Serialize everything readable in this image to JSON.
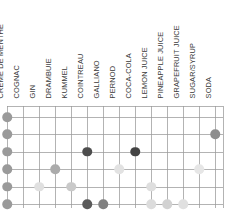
{
  "chart_data": {
    "type": "scatter",
    "title": "",
    "xlabel": "",
    "ylabel": "",
    "grid": true,
    "legend": null,
    "categories": [
      "CRÈME DE MENTHE",
      "COGNAC",
      "GIN",
      "DRAMBUIE",
      "KUMMEL",
      "COINTREAU",
      "GALLIANO",
      "PERNOD",
      "COCA-COLA",
      "LEMON JUICE",
      "PINEAPPLE JUICE",
      "GRAPEFRUIT JUICE",
      "SUGAR/SYRUP",
      "SODA"
    ],
    "rows": [
      {
        "row": 1,
        "points": [
          {
            "col": 1,
            "color": "#9a9a9a"
          }
        ]
      },
      {
        "row": 2,
        "points": [
          {
            "col": 1,
            "color": "#9a9a9a"
          },
          {
            "col": 14,
            "color": "#8e8e8e"
          }
        ]
      },
      {
        "row": 3,
        "points": [
          {
            "col": 1,
            "color": "#9a9a9a"
          },
          {
            "col": 6,
            "color": "#4d4d4d"
          },
          {
            "col": 9,
            "color": "#434343"
          }
        ]
      },
      {
        "row": 4,
        "points": [
          {
            "col": 1,
            "color": "#9a9a9a"
          },
          {
            "col": 4,
            "color": "#ababab"
          },
          {
            "col": 8,
            "color": "#e2e2e2"
          },
          {
            "col": 13,
            "color": "#e6e6e6"
          }
        ]
      },
      {
        "row": 5,
        "points": [
          {
            "col": 1,
            "color": "#9a9a9a"
          },
          {
            "col": 3,
            "color": "#e0e0e0"
          },
          {
            "col": 5,
            "color": "#c9c9c9"
          },
          {
            "col": 10,
            "color": "#dedede"
          }
        ]
      },
      {
        "row": 6,
        "points": [
          {
            "col": 1,
            "color": "#9a9a9a"
          },
          {
            "col": 6,
            "color": "#5a5a5a"
          },
          {
            "col": 7,
            "color": "#808080"
          },
          {
            "col": 10,
            "color": "#dcdcdc"
          },
          {
            "col": 11,
            "color": "#d2d2d2"
          },
          {
            "col": 12,
            "color": "#e0e0e0"
          }
        ]
      }
    ],
    "n_columns": 14,
    "n_rows": 6,
    "xlim": [
      0.5,
      14.5
    ],
    "ylim": [
      0.5,
      6.5
    ],
    "colors": {
      "grid": "#9a9a9a",
      "label_text": "#3a3a3a",
      "dot_dark": "#434343",
      "dot_mid": "#9a9a9a",
      "dot_light": "#e0e0e0"
    }
  }
}
